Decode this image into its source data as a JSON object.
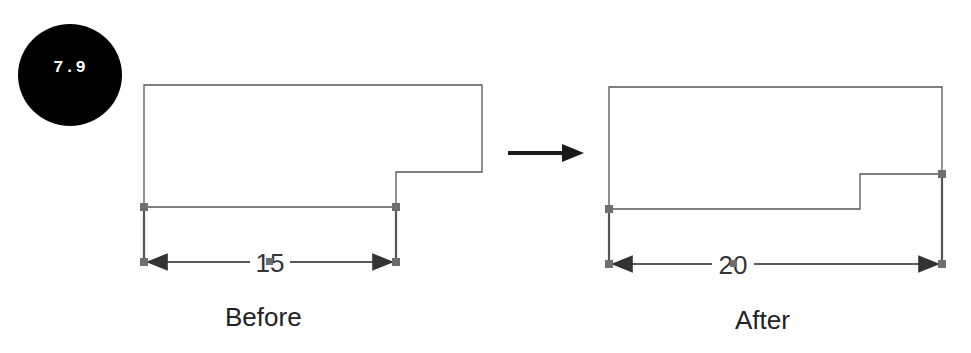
{
  "figure": {
    "badge_label": "7.9",
    "before": {
      "caption": "Before",
      "dimension_value": "15"
    },
    "after": {
      "caption": "After",
      "dimension_value": "20"
    },
    "transition_arrow": "right-arrow"
  },
  "colors": {
    "outline": "#555555",
    "handle": "#6e6e6e",
    "dimension_line": "#5a5a5a",
    "arrow": "#1a1a1a",
    "badge_bg": "#000000",
    "badge_text": "#ffffff"
  }
}
